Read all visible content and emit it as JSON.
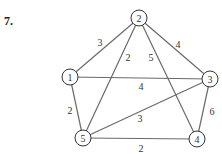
{
  "problem_number": "7.",
  "graph": {
    "nodes": [
      {
        "id": "1",
        "label": "1",
        "x": 70,
        "y": 77
      },
      {
        "id": "2",
        "label": "2",
        "x": 139,
        "y": 18
      },
      {
        "id": "3",
        "label": "3",
        "x": 210,
        "y": 79
      },
      {
        "id": "4",
        "label": "4",
        "x": 197,
        "y": 139
      },
      {
        "id": "5",
        "label": "5",
        "x": 83,
        "y": 138
      }
    ],
    "edges": [
      {
        "from": "1",
        "to": "2",
        "weight": "3",
        "lx": 100,
        "ly": 42
      },
      {
        "from": "2",
        "to": "3",
        "weight": "4",
        "lx": 178,
        "ly": 44
      },
      {
        "from": "2",
        "to": "5",
        "weight": "2",
        "lx": 128,
        "ly": 57
      },
      {
        "from": "2",
        "to": "4",
        "weight": "5",
        "lx": 151,
        "ly": 57
      },
      {
        "from": "1",
        "to": "3",
        "weight": "4",
        "lx": 141,
        "ly": 86
      },
      {
        "from": "1",
        "to": "5",
        "weight": "2",
        "lx": 70,
        "ly": 110
      },
      {
        "from": "5",
        "to": "3",
        "weight": "3",
        "lx": 140,
        "ly": 118
      },
      {
        "from": "3",
        "to": "4",
        "weight": "6",
        "lx": 212,
        "ly": 111
      },
      {
        "from": "5",
        "to": "4",
        "weight": "2",
        "lx": 141,
        "ly": 148
      }
    ]
  }
}
